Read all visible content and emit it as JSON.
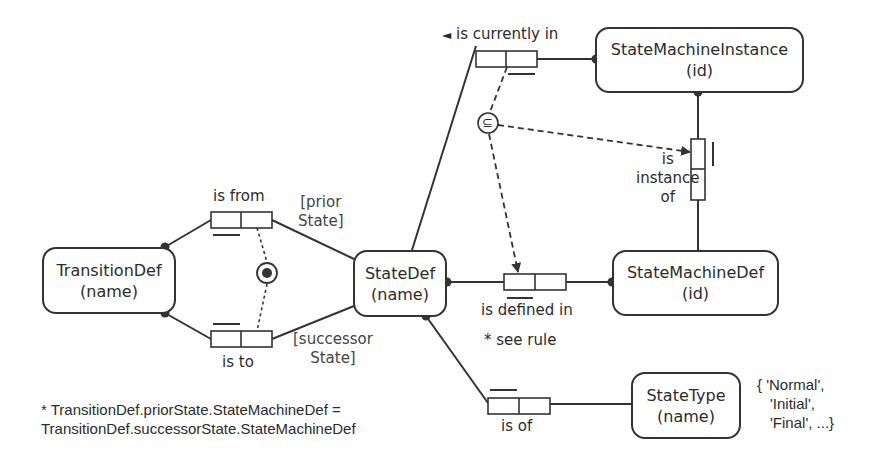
{
  "entities": {
    "transition_def": {
      "name": "TransitionDef",
      "ref": "(name)"
    },
    "state_def": {
      "name": "StateDef",
      "ref": "(name)"
    },
    "state_machine_instance": {
      "name": "StateMachineInstance",
      "ref": "(id)"
    },
    "state_machine_def": {
      "name": "StateMachineDef",
      "ref": "(id)"
    },
    "state_type": {
      "name": "StateType",
      "ref": "(name)"
    }
  },
  "fact_types": {
    "is_from": {
      "reading": "is from",
      "role_name": [
        "[prior",
        "State]"
      ]
    },
    "is_to": {
      "reading": "is to",
      "role_name": [
        "[successor",
        "State]"
      ]
    },
    "is_currently_in": {
      "reading": "is currently in",
      "direction_marker": "◄"
    },
    "is_instance_of": {
      "reading": [
        "is",
        "instance",
        "of"
      ]
    },
    "is_defined_in": {
      "reading": "is defined in",
      "note": "* see rule"
    },
    "is_of": {
      "reading": "is of"
    }
  },
  "constraints": {
    "subset_symbol": "⊆",
    "external_uniqueness": "⦿"
  },
  "value_constraint": [
    "{ 'Normal',",
    "'Initial',",
    "'Final', ...}"
  ],
  "rule_text": [
    "* TransitionDef.priorState.StateMachineDef =",
    "TransitionDef.successorState.StateMachineDef"
  ]
}
